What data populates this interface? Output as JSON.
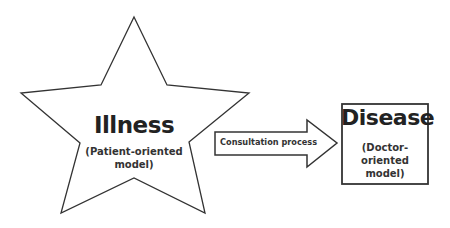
{
  "diagram": {
    "star": {
      "title": "Illness",
      "subtitle_line1": "(Patient-oriented",
      "subtitle_line2": "model)"
    },
    "arrow": {
      "label": "Consultation process"
    },
    "box": {
      "title": "Disease",
      "subtitle_line1": "(Doctor-oriented",
      "subtitle_line2": "model)"
    },
    "colors": {
      "stroke": "#333333",
      "fill": "#ffffff"
    }
  }
}
